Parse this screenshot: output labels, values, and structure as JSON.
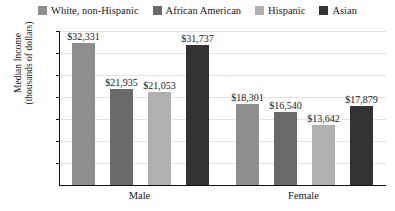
{
  "chart_data": {
    "type": "bar",
    "title": "",
    "subtitle": "",
    "xlabel": "",
    "ylabel": "Median Income\n(thousands of dollars)",
    "ylabel_line1": "Median Income",
    "ylabel_line2": "(thousands of dollars)",
    "categories": [
      "Male",
      "Female"
    ],
    "ylim": [
      0,
      35
    ],
    "yticks": [
      5,
      10,
      15,
      20,
      25,
      30,
      35
    ],
    "ytick_labels": [
      "5",
      "10",
      "15",
      "20",
      "25",
      "30",
      "35"
    ],
    "grid": true,
    "legend_position": "top-center",
    "value_prefix": "$",
    "units": "dollars",
    "series": [
      {
        "name": "White, non-Hispanic",
        "color": "#8e8e8e",
        "values": [
          32331,
          21935
        ],
        "values_thousands": [
          32.331,
          21.935
        ],
        "labels": [
          "$32,331",
          "$18,301"
        ]
      },
      {
        "name": "African American",
        "color": "#6a6a6a",
        "values": [
          21935,
          16540
        ],
        "values_thousands": [
          21.935,
          16.54
        ],
        "labels": [
          "$21,935",
          "$16,540"
        ]
      },
      {
        "name": "Hispanic",
        "color": "#b0b0b0",
        "values": [
          21053,
          13642
        ],
        "values_thousands": [
          21.053,
          13.642
        ],
        "labels": [
          "$21,053",
          "$13,642"
        ]
      },
      {
        "name": "Asian",
        "color": "#333333",
        "values": [
          31737,
          17879
        ],
        "values_thousands": [
          31.737,
          17.879
        ],
        "labels": [
          "$31,737",
          "$17,879"
        ]
      }
    ],
    "bars": [
      {
        "group": "Male",
        "series": "White, non-Hispanic",
        "value": 32331,
        "value_thousands": 32.331,
        "label": "$32,331",
        "color": "#8e8e8e"
      },
      {
        "group": "Male",
        "series": "African American",
        "value": 21935,
        "value_thousands": 21.935,
        "label": "$21,935",
        "color": "#6a6a6a"
      },
      {
        "group": "Male",
        "series": "Hispanic",
        "value": 21053,
        "value_thousands": 21.053,
        "label": "$21,053",
        "color": "#b0b0b0"
      },
      {
        "group": "Male",
        "series": "Asian",
        "value": 31737,
        "value_thousands": 31.737,
        "label": "$31,737",
        "color": "#333333"
      },
      {
        "group": "Female",
        "series": "White, non-Hispanic",
        "value": 18301,
        "value_thousands": 18.301,
        "label": "$18,301",
        "color": "#8e8e8e"
      },
      {
        "group": "Female",
        "series": "African American",
        "value": 16540,
        "value_thousands": 16.54,
        "label": "$16,540",
        "color": "#6a6a6a"
      },
      {
        "group": "Female",
        "series": "Hispanic",
        "value": 13642,
        "value_thousands": 13.642,
        "label": "$13,642",
        "color": "#b0b0b0"
      },
      {
        "group": "Female",
        "series": "Asian",
        "value": 17879,
        "value_thousands": 17.879,
        "label": "$17,879",
        "color": "#333333"
      }
    ]
  },
  "legend": {
    "items": [
      {
        "label": "White, non-Hispanic",
        "color": "#8e8e8e"
      },
      {
        "label": "African American",
        "color": "#6a6a6a"
      },
      {
        "label": "Hispanic",
        "color": "#b0b0b0"
      },
      {
        "label": "Asian",
        "color": "#333333"
      }
    ]
  },
  "axes": {
    "y_title_line1": "Median Income",
    "y_title_line2": "(thousands of dollars)",
    "y_ticks": [
      "35",
      "30",
      "25",
      "20",
      "15",
      "10",
      "5"
    ],
    "x_groups": [
      "Male",
      "Female"
    ]
  }
}
